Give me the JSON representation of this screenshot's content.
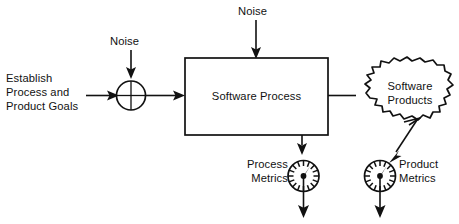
{
  "diagram": {
    "colors": {
      "stroke": "#111111",
      "background": "#ffffff",
      "text": "#111111"
    },
    "nodes": {
      "goals": {
        "name": "establish-process-and-product-goals",
        "line1": "Establish",
        "line2": "Process and",
        "line3": "Product Goals"
      },
      "summing_junction": {
        "name": "summing-junction",
        "symbol": "+"
      },
      "noise_left": {
        "name": "noise-left",
        "label": "Noise"
      },
      "noise_top": {
        "name": "noise-top",
        "label": "Noise"
      },
      "software_process": {
        "name": "software-process-box",
        "label": "Software Process"
      },
      "software_products": {
        "name": "software-products-cloud",
        "line1": "Software",
        "line2": "Products"
      },
      "process_metrics": {
        "name": "process-metrics",
        "line1": "Process",
        "line2": "Metrics",
        "icon": "gauge-icon"
      },
      "product_metrics": {
        "name": "product-metrics",
        "line1": "Product",
        "line2": "Metrics",
        "icon": "gauge-icon"
      }
    },
    "connections": [
      {
        "name": "goals-to-junction",
        "from": "goals",
        "to": "summing_junction",
        "arrow": "right"
      },
      {
        "name": "noise-left-to-junction",
        "from": "noise_left",
        "to": "summing_junction",
        "arrow": "down"
      },
      {
        "name": "junction-to-process",
        "from": "summing_junction",
        "to": "software_process",
        "arrow": "right"
      },
      {
        "name": "noise-top-to-process",
        "from": "noise_top",
        "to": "software_process",
        "arrow": "down"
      },
      {
        "name": "process-to-products",
        "from": "software_process",
        "to": "software_products",
        "arrow": "right"
      },
      {
        "name": "process-to-process-metrics",
        "from": "software_process",
        "to": "process_metrics",
        "arrow": "down"
      },
      {
        "name": "products-to-product-metrics",
        "from": "software_products",
        "to": "product_metrics",
        "arrow": "down-left"
      },
      {
        "name": "process-metrics-output",
        "from": "process_metrics",
        "to": "",
        "arrow": "down"
      },
      {
        "name": "product-metrics-output",
        "from": "product_metrics",
        "to": "",
        "arrow": "down"
      }
    ]
  }
}
